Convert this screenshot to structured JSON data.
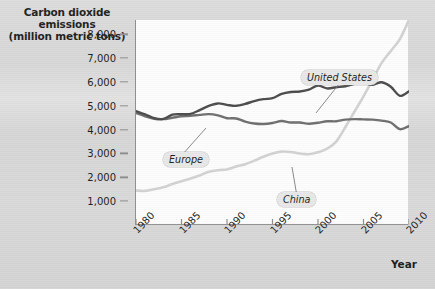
{
  "chart_data": {
    "type": "line",
    "title": "Carbon dioxide emissions (million metric tons)",
    "title_lines": [
      "Carbon dioxide",
      "emissions",
      "(million metric tons)"
    ],
    "xlabel": "Year",
    "ylabel": "Carbon dioxide emissions (million metric tons)",
    "xlim": [
      1980,
      2010
    ],
    "ylim": [
      0,
      8600
    ],
    "grid": false,
    "legend_position": "inline-callouts",
    "ytick_labels": [
      "1,000",
      "2,000",
      "3,000",
      "4,000",
      "5,000",
      "6,000",
      "7,000",
      "8,000"
    ],
    "ytick_values": [
      1000,
      2000,
      3000,
      4000,
      5000,
      6000,
      7000,
      8000
    ],
    "xtick_labels": [
      "1980",
      "1985",
      "1990",
      "1995",
      "2000",
      "2005",
      "2010"
    ],
    "xtick_values": [
      1980,
      1985,
      1990,
      1995,
      2000,
      2005,
      2010
    ],
    "x": [
      1980,
      1981,
      1982,
      1983,
      1984,
      1985,
      1986,
      1987,
      1988,
      1989,
      1990,
      1991,
      1992,
      1993,
      1994,
      1995,
      1996,
      1997,
      1998,
      1999,
      2000,
      2001,
      2002,
      2003,
      2004,
      2005,
      2006,
      2007,
      2008,
      2009,
      2010
    ],
    "series": [
      {
        "name": "United States",
        "color": "#4a4a4a",
        "values": [
          4780,
          4640,
          4480,
          4450,
          4630,
          4650,
          4660,
          4820,
          5000,
          5100,
          5040,
          5000,
          5080,
          5200,
          5280,
          5320,
          5500,
          5580,
          5600,
          5680,
          5850,
          5730,
          5780,
          5820,
          5920,
          5960,
          5880,
          5990,
          5800,
          5420,
          5610
        ]
      },
      {
        "name": "Europe",
        "color": "#6e6e6e",
        "values": [
          4700,
          4560,
          4460,
          4440,
          4500,
          4560,
          4580,
          4620,
          4650,
          4600,
          4480,
          4470,
          4340,
          4260,
          4240,
          4280,
          4360,
          4300,
          4300,
          4250,
          4290,
          4350,
          4350,
          4420,
          4440,
          4430,
          4420,
          4380,
          4300,
          4020,
          4150
        ]
      },
      {
        "name": "China",
        "color": "#d2d2d2",
        "values": [
          1450,
          1430,
          1500,
          1580,
          1720,
          1840,
          1950,
          2080,
          2230,
          2300,
          2330,
          2450,
          2550,
          2700,
          2860,
          3000,
          3080,
          3060,
          3000,
          2970,
          3050,
          3200,
          3500,
          4100,
          4750,
          5400,
          6100,
          6800,
          7300,
          7800,
          8600
        ]
      }
    ],
    "annotations": [
      {
        "label": "United States",
        "x": 301,
        "y": 70,
        "leader_to_x": 315,
        "leader_to_y": 113
      },
      {
        "label": "Europe",
        "x": 163,
        "y": 152,
        "leader_to_x": 205,
        "leader_to_y": 128
      },
      {
        "label": "China",
        "x": 277,
        "y": 192,
        "leader_to_x": 291,
        "leader_to_y": 167
      }
    ]
  }
}
